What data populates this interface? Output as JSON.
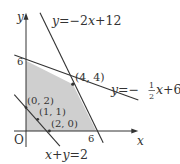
{
  "figure": {
    "type": "linear-programming-feasible-region",
    "origin_px": [
      26,
      131
    ],
    "unit_px": 11.7,
    "colors": {
      "line": "#333333",
      "shade": "#cfcfcf",
      "background": "#ffffff"
    },
    "axes": {
      "x_label": "x",
      "y_label": "y",
      "origin_label": "O",
      "x_end": 9.6,
      "y_end": 10.1,
      "x_tick_label": "6",
      "y_tick_label": "6"
    },
    "lines": [
      {
        "name": "line-y-minus2x-plus12",
        "equation": "y = −2x + 12",
        "label_parts": [
          "y",
          "=−2",
          "x",
          "+12"
        ],
        "from": [
          1.2,
          10.1
        ],
        "to": [
          6.6,
          -1.0
        ]
      },
      {
        "name": "line-y-minus-half-x-plus6",
        "equation": "y = −1/2 x + 6",
        "label_parts": [
          "y",
          "=−",
          "1",
          "2",
          "x",
          "+6"
        ],
        "from": [
          -1.0,
          6.5
        ],
        "to": [
          9.6,
          2.65
        ]
      },
      {
        "name": "line-x-plus-y-eq-2",
        "equation": "x + y = 2",
        "label_parts": [
          "x",
          "+",
          "y",
          "=2"
        ],
        "from": [
          -1.0,
          3.1
        ],
        "to": [
          2.9,
          -1.3
        ]
      }
    ],
    "feasible_region": [
      [
        0,
        0
      ],
      [
        0,
        6
      ],
      [
        4,
        4
      ],
      [
        6,
        0
      ]
    ],
    "points": [
      {
        "label": "(4, 4)",
        "x": 4,
        "y": 4
      },
      {
        "label": "(0, 2)",
        "x": 0,
        "y": 2
      },
      {
        "label": "(1, 1)",
        "x": 1,
        "y": 1
      },
      {
        "label": "(2, 0)",
        "x": 2,
        "y": 0
      }
    ]
  }
}
